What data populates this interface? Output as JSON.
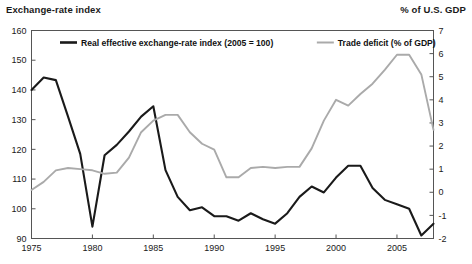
{
  "header": {
    "left_label": "Exchange-rate index",
    "right_label": "% of U.S. GDP"
  },
  "colors": {
    "series_black": "#1a1a1a",
    "series_gray": "#aaaaaa",
    "frame": "#555555",
    "text": "#1a1a1a",
    "background": "#ffffff"
  },
  "chart_data": {
    "type": "line",
    "title": "",
    "subtitle": "",
    "xlabel": "",
    "ylabel": "Exchange-rate index",
    "y2label": "% of U.S. GDP",
    "grid": false,
    "legend_position": "top-inside",
    "xlim": [
      1975,
      2008
    ],
    "xticks": [
      1975,
      1980,
      1985,
      1990,
      1995,
      2000,
      2005
    ],
    "xtick_labels": [
      "1975",
      "1980",
      "1985",
      "1990",
      "1995",
      "2000",
      "2005"
    ],
    "ylim": [
      90,
      160
    ],
    "yticks": [
      90,
      100,
      110,
      120,
      130,
      140,
      150,
      160
    ],
    "ytick_labels": [
      "90",
      "100",
      "110",
      "120",
      "130",
      "140",
      "150",
      "160"
    ],
    "y2lim": [
      -2,
      7
    ],
    "y2ticks": [
      -2,
      -1,
      0,
      1,
      2,
      3,
      4,
      5,
      6,
      7
    ],
    "y2tick_labels": [
      "-2",
      "-1",
      "0",
      "1",
      "2",
      "3",
      "4",
      "5",
      "6",
      "7"
    ],
    "x": [
      1975,
      1976,
      1977,
      1978,
      1979,
      1980,
      1981,
      1982,
      1983,
      1984,
      1985,
      1986,
      1987,
      1988,
      1989,
      1990,
      1991,
      1992,
      1993,
      1994,
      1995,
      1996,
      1997,
      1998,
      1999,
      2000,
      2001,
      2002,
      2003,
      2004,
      2005,
      2006,
      2007,
      2008
    ],
    "series": [
      {
        "name": "Real effective exchange-rate index (2005 = 100)",
        "axis": "left",
        "color": "#1a1a1a",
        "values": [
          140.0,
          144.2,
          143.3,
          131.0,
          118.5,
          94.0,
          118.0,
          121.5,
          126.0,
          131.0,
          134.5,
          113.0,
          104.0,
          99.5,
          100.5,
          97.5,
          97.5,
          96.0,
          98.5,
          96.5,
          95.0,
          98.5,
          104.0,
          107.5,
          105.5,
          110.5,
          114.5,
          114.5,
          107.0,
          103.0,
          101.5,
          100.0,
          91.0,
          95.0
        ]
      },
      {
        "name": "Trade deficit (% of GDP)",
        "axis": "right",
        "color": "#aaaaaa",
        "values": [
          0.1,
          0.45,
          0.95,
          1.05,
          1.0,
          0.95,
          0.8,
          0.85,
          1.5,
          2.6,
          3.1,
          3.35,
          3.35,
          2.6,
          2.1,
          1.85,
          0.65,
          0.65,
          1.05,
          1.1,
          1.05,
          1.1,
          1.1,
          1.9,
          3.1,
          4.0,
          3.75,
          4.25,
          4.7,
          5.3,
          5.95,
          5.95,
          5.1,
          2.7
        ]
      }
    ],
    "legend": [
      {
        "label": "Real effective exchange-rate index (2005 = 100)",
        "color": "#1a1a1a"
      },
      {
        "label": "Trade deficit (% of GDP)",
        "color": "#aaaaaa"
      }
    ]
  }
}
